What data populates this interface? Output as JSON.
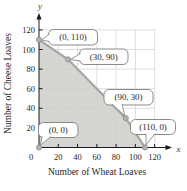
{
  "chart_data": {
    "type": "area",
    "title": "",
    "xlabel": "Number of Wheat Loaves",
    "ylabel": "Number of Cheese Loaves",
    "x_axis_symbol": "x",
    "y_axis_symbol": "y",
    "xlim": [
      0,
      130
    ],
    "ylim": [
      0,
      130
    ],
    "xticks": [
      0,
      20,
      40,
      60,
      80,
      100,
      120
    ],
    "yticks": [
      20,
      40,
      60,
      80,
      100,
      120
    ],
    "grid": true,
    "region_vertices": [
      [
        0,
        0
      ],
      [
        0,
        110
      ],
      [
        30,
        90
      ],
      [
        90,
        30
      ],
      [
        110,
        0
      ]
    ],
    "boundary_line": [
      [
        0,
        110
      ],
      [
        30,
        90
      ],
      [
        90,
        30
      ],
      [
        110,
        0
      ]
    ],
    "points": [
      {
        "x": 0,
        "y": 110,
        "label": "(0, 110)"
      },
      {
        "x": 30,
        "y": 90,
        "label": "(30, 90)"
      },
      {
        "x": 90,
        "y": 30,
        "label": "(90, 30)"
      },
      {
        "x": 110,
        "y": 0,
        "label": "(110, 0)"
      },
      {
        "x": 0,
        "y": 0,
        "label": "(0, 0)"
      }
    ],
    "callout_layout": [
      {
        "box": {
          "x": 48.5,
          "y": 29.5,
          "w": 49,
          "h": 15.5
        },
        "tail_base": [
          [
            49.5,
            34
          ],
          [
            49.5,
            41.5
          ]
        ],
        "target": [
          41.5,
          40
        ]
      },
      {
        "box": {
          "x": 79.5,
          "y": 49,
          "w": 48.5,
          "h": 15.5
        },
        "tail_base": [
          [
            80.5,
            53.5
          ],
          [
            80.5,
            61
          ]
        ],
        "target": [
          70.5,
          59.5
        ]
      },
      {
        "box": {
          "x": 104,
          "y": 89.5,
          "w": 49,
          "h": 15.5
        },
        "tail_base": [
          [
            112,
            104
          ],
          [
            122,
            104
          ]
        ],
        "target": [
          124.8,
          115.8
        ]
      },
      {
        "box": {
          "x": 130.5,
          "y": 119.5,
          "w": 45,
          "h": 15
        },
        "tail_base": [
          [
            146,
            133.5
          ],
          [
            155,
            133.5
          ]
        ],
        "target": [
          146,
          145
        ]
      },
      {
        "box": {
          "x": 38.5,
          "y": 122.5,
          "w": 39.5,
          "h": 15
        },
        "tail_base": [
          [
            42,
            136.5
          ],
          [
            51,
            136.5
          ]
        ],
        "target": [
          40.5,
          145
        ]
      }
    ],
    "colors": {
      "region_fill": "#cecec9",
      "region_opacity": 0.85,
      "boundary": "#a6a6a6",
      "grid": "#d7d7d7",
      "axis": "#1a1a1a",
      "point_fill": "#b3b3b0",
      "point_stroke": "#8a8a8a",
      "callout_fill": "#ffffff",
      "callout_border": "#8a8a8a",
      "text": "#1f1f1f"
    }
  }
}
